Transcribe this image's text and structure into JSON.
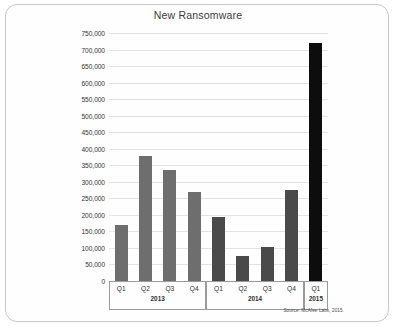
{
  "card": {
    "title": "New Ransomware"
  },
  "source": {
    "text": "Source: McAfee Labs, 2015."
  },
  "chart_data": {
    "type": "bar",
    "title": "New Ransomware",
    "xlabel": "",
    "ylabel": "",
    "ylim": [
      0,
      750000
    ],
    "grid": true,
    "legend": "none",
    "categories": [
      "Q1",
      "Q2",
      "Q3",
      "Q4",
      "Q1",
      "Q2",
      "Q3",
      "Q4",
      "Q1"
    ],
    "groups": [
      {
        "year": "2013",
        "quarters": [
          "Q1",
          "Q2",
          "Q3",
          "Q4"
        ]
      },
      {
        "year": "2014",
        "quarters": [
          "Q1",
          "Q2",
          "Q3",
          "Q4"
        ]
      },
      {
        "year": "2015",
        "quarters": [
          "Q1"
        ]
      }
    ],
    "values": [
      170000,
      378000,
      335000,
      268000,
      194000,
      76000,
      103000,
      275000,
      720000
    ],
    "bars": [
      {
        "label": "Q1",
        "year": "2013",
        "value": 170000,
        "color": "#6e6e6e"
      },
      {
        "label": "Q2",
        "year": "2013",
        "value": 378000,
        "color": "#6e6e6e"
      },
      {
        "label": "Q3",
        "year": "2013",
        "value": 335000,
        "color": "#6e6e6e"
      },
      {
        "label": "Q4",
        "year": "2013",
        "value": 268000,
        "color": "#6e6e6e"
      },
      {
        "label": "Q1",
        "year": "2014",
        "value": 194000,
        "color": "#4a4a4a"
      },
      {
        "label": "Q2",
        "year": "2014",
        "value": 76000,
        "color": "#4a4a4a"
      },
      {
        "label": "Q3",
        "year": "2014",
        "value": 103000,
        "color": "#4a4a4a"
      },
      {
        "label": "Q4",
        "year": "2014",
        "value": 275000,
        "color": "#4a4a4a"
      },
      {
        "label": "Q1",
        "year": "2015",
        "value": 720000,
        "color": "#0d0d0d"
      }
    ],
    "y_ticks": [
      {
        "value": 750000,
        "label": "750,000"
      },
      {
        "value": 700000,
        "label": "700,000"
      },
      {
        "value": 650000,
        "label": "650,000"
      },
      {
        "value": 600000,
        "label": "600,000"
      },
      {
        "value": 550000,
        "label": "550,000"
      },
      {
        "value": 500000,
        "label": "500,000"
      },
      {
        "value": 450000,
        "label": "450,000"
      },
      {
        "value": 400000,
        "label": "400,000"
      },
      {
        "value": 350000,
        "label": "350,000"
      },
      {
        "value": 300000,
        "label": "300,000"
      },
      {
        "value": 250000,
        "label": "250,000"
      },
      {
        "value": 200000,
        "label": "200,000"
      },
      {
        "value": 150000,
        "label": "150,000"
      },
      {
        "value": 100000,
        "label": "100,000"
      },
      {
        "value": 50000,
        "label": "50,000"
      },
      {
        "value": 0,
        "label": "0"
      }
    ]
  }
}
